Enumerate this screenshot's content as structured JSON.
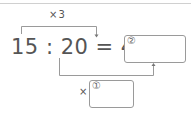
{
  "problem": {
    "top_multiplier_label": "×3",
    "equation_text": "15 : 20 = 45 :",
    "terms": [
      "15",
      "20",
      "45"
    ],
    "answer_boxes": [
      {
        "id": "1",
        "marker": "①",
        "prefix": "×",
        "value": ""
      },
      {
        "id": "2",
        "marker": "②",
        "value": ""
      }
    ]
  },
  "colors": {
    "text": "#555555",
    "lines": "#9a9a9a",
    "top_rule": "#d0d0d0"
  }
}
